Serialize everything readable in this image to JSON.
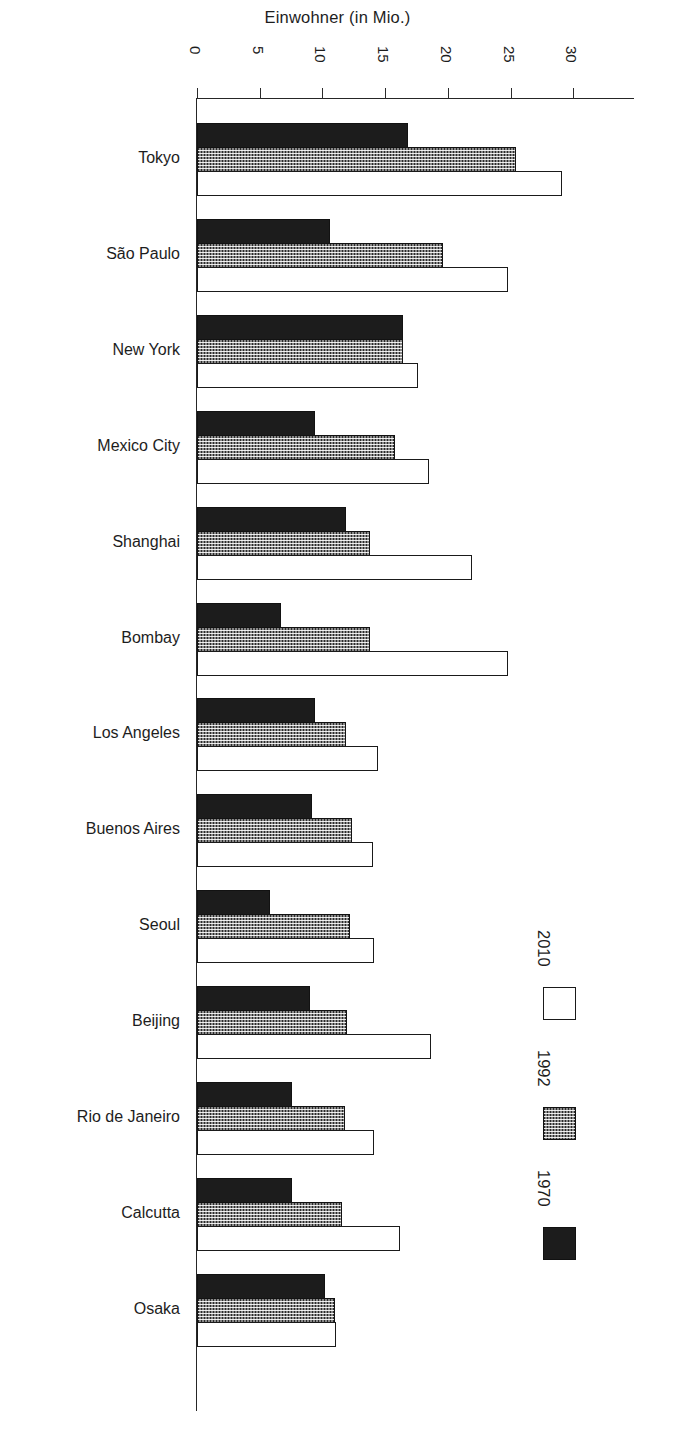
{
  "chart_data": {
    "type": "bar",
    "orientation": "horizontal",
    "title": "Einwohner (in Mio.)",
    "xlabel": "Einwohner (in Mio.)",
    "ylabel": "",
    "xlim": [
      0,
      33
    ],
    "xticks": [
      "0",
      "5",
      "10",
      "15",
      "20",
      "25",
      "30"
    ],
    "xtick_values": [
      0,
      5,
      10,
      15,
      20,
      25,
      30
    ],
    "grid": false,
    "legend_position": "right",
    "categories": [
      "Tokyo",
      "São Paulo",
      "New York",
      "Mexico City",
      "Shanghai",
      "Bombay",
      "Los Angeles",
      "Buenos Aires",
      "Seoul",
      "Beijing",
      "Rio de Janeiro",
      "Calcutta",
      "Osaka"
    ],
    "series": [
      {
        "name": "1970",
        "swatch": "solid-black",
        "color": "#1c1c1c",
        "values": [
          16.8,
          10.6,
          16.4,
          9.4,
          11.9,
          6.7,
          9.4,
          9.2,
          5.8,
          9.0,
          7.6,
          7.6,
          10.2
        ]
      },
      {
        "name": "1992",
        "swatch": "checkered",
        "color": "#2a2a2a",
        "values": [
          25.4,
          19.6,
          16.4,
          15.8,
          13.8,
          13.8,
          11.9,
          12.4,
          12.2,
          12.0,
          11.8,
          11.6,
          11.0
        ]
      },
      {
        "name": "2010",
        "swatch": "white-outline",
        "color": "#ffffff",
        "values": [
          29.1,
          24.8,
          17.6,
          18.5,
          21.9,
          24.8,
          14.4,
          14.0,
          14.1,
          18.7,
          14.1,
          16.2,
          11.1
        ]
      }
    ]
  },
  "legend": {
    "entries": [
      {
        "label": "2010",
        "swatch": "white-outline"
      },
      {
        "label": "1992",
        "swatch": "checkered"
      },
      {
        "label": "1970",
        "swatch": "solid-black"
      }
    ]
  }
}
